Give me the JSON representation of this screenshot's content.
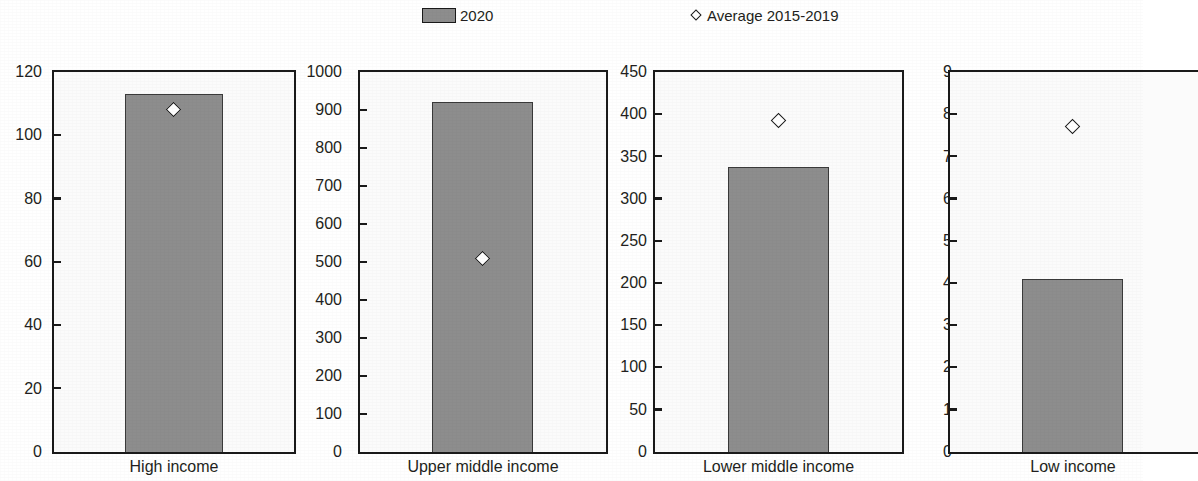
{
  "legend": {
    "items": [
      {
        "label": "2020",
        "marker": "bar-swatch-icon",
        "color": "#8d8d8d"
      },
      {
        "label": "Average 2015-2019",
        "marker": "diamond-marker-icon",
        "color": "#ffffff"
      }
    ]
  },
  "chart_data": {
    "type": "bar",
    "title": "",
    "xlabel": "",
    "ylabel": "",
    "grid": false,
    "legend_position": "top-center",
    "categories": [
      "High income",
      "Upper middle income",
      "Lower middle income",
      "Low income"
    ],
    "series": [
      {
        "name": "2020",
        "values": [
          113,
          920,
          337,
          4.1
        ]
      },
      {
        "name": "Average 2015-2019",
        "values": [
          108,
          510,
          392,
          7.7
        ]
      }
    ],
    "panels": [
      {
        "category": "High income",
        "ylim": [
          0,
          120
        ],
        "yticks": [
          0,
          20,
          40,
          60,
          80,
          100,
          120
        ],
        "ytick_labels": [
          "0",
          "20",
          "40",
          "60",
          "80",
          "100",
          "120"
        ],
        "bar_value": 113,
        "marker_value": 108
      },
      {
        "category": "Upper middle income",
        "ylim": [
          0,
          1000
        ],
        "yticks": [
          0,
          100,
          200,
          300,
          400,
          500,
          600,
          700,
          800,
          900,
          1000
        ],
        "ytick_labels": [
          "0",
          "100",
          "200",
          "300",
          "400",
          "500",
          "600",
          "700",
          "800",
          "900",
          "1000"
        ],
        "bar_value": 920,
        "marker_value": 510
      },
      {
        "category": "Lower middle income",
        "ylim": [
          0,
          450
        ],
        "yticks": [
          0,
          50,
          100,
          150,
          200,
          250,
          300,
          350,
          400,
          450
        ],
        "ytick_labels": [
          "0",
          "50",
          "100",
          "150",
          "200",
          "250",
          "300",
          "350",
          "400",
          "450"
        ],
        "bar_value": 337,
        "marker_value": 392
      },
      {
        "category": "Low income",
        "ylim": [
          0,
          9
        ],
        "yticks": [
          0,
          1,
          2,
          3,
          4,
          5,
          6,
          7,
          8,
          9
        ],
        "ytick_labels": [
          "0",
          "1",
          "2",
          "3",
          "4",
          "5",
          "6",
          "7",
          "8",
          "9"
        ],
        "bar_value": 4.1,
        "marker_value": 7.7
      }
    ]
  }
}
